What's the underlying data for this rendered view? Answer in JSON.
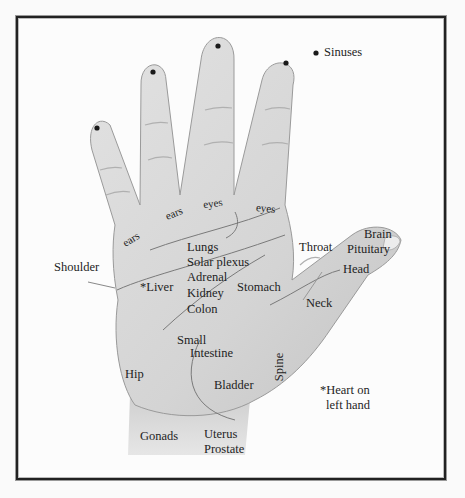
{
  "legend": {
    "sinuses": "Sinuses"
  },
  "labels": {
    "ears_1": "ears",
    "ears_2": "ears",
    "eyes_1": "eyes",
    "eyes_2": "eyes",
    "shoulder": "Shoulder",
    "liver": "*Liver",
    "lungs": "Lungs",
    "solar_plexus": "Solar plexus",
    "adrenal": "Adrenal",
    "kidney": "Kidney",
    "colon": "Colon",
    "stomach": "Stomach",
    "throat": "Throat",
    "brain": "Brain",
    "pituitary": "Pituitary",
    "head": "Head",
    "neck": "Neck",
    "small": "Small",
    "intestine": "Intestine",
    "hip": "Hip",
    "bladder": "Bladder",
    "spine": "Spine",
    "gonads": "Gonads",
    "uterus": "Uterus",
    "prostate": "Prostate"
  },
  "note": {
    "line1": "*Heart on",
    "line2": "left hand"
  },
  "colors": {
    "skin": "#d9d9d9",
    "skin_shade": "#bdbdbd",
    "ink": "#1e1e1e",
    "frame": "#222222"
  }
}
